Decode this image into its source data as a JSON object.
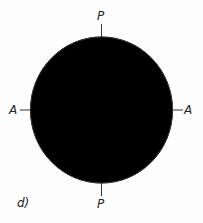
{
  "figure": {
    "panel_label": "d)",
    "labels": {
      "top": "P",
      "bottom": "P",
      "left": "A",
      "right": "A"
    }
  }
}
